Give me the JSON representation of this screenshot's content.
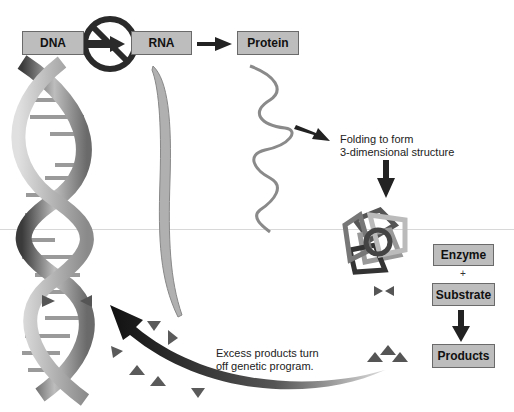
{
  "diagram": {
    "pathway": {
      "dna_label": "DNA",
      "rna_label": "RNA",
      "protein_label": "Protein"
    },
    "folding_text": {
      "line1": "Folding to form",
      "line2": "3-dimensional structure"
    },
    "reaction": {
      "enzyme_label": "Enzyme",
      "plus": "+",
      "substrate_label": "Substrate",
      "products_label": "Products"
    },
    "feedback_text": {
      "line1": "Excess products turn",
      "line2": "off genetic program."
    },
    "colors": {
      "box_fill": "#bdbdbd",
      "box_border": "#6a6a6a",
      "arrow": "#222222",
      "prohibition_sign": "#2a2a2a",
      "triangle": "#555555"
    }
  }
}
